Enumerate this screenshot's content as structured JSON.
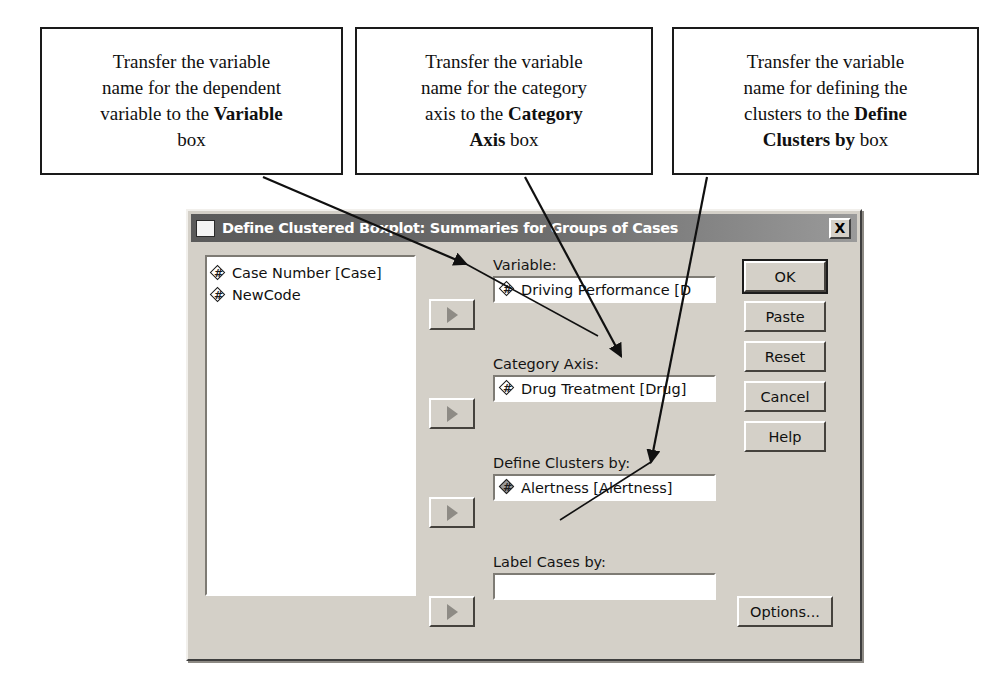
{
  "callouts": [
    {
      "id": "variable",
      "line1": "Transfer the variable",
      "line2": "name for the dependent",
      "line3_pre": "variable to the ",
      "line3_bold": "Variable",
      "line4": "box"
    },
    {
      "id": "category-axis",
      "line1": "Transfer the variable",
      "line2": "name for the category",
      "line3_pre": "axis to the ",
      "line3_bold": "Category",
      "line4_bold": "Axis",
      "line4_post": " box"
    },
    {
      "id": "clusters",
      "line1": "Transfer the variable",
      "line2": "name for defining the",
      "line3_pre": "clusters to the ",
      "line3_bold": "Define",
      "line4_bold": "Clusters by",
      "line4_post": " box"
    }
  ],
  "dialog": {
    "title": "Define Clustered Boxplot: Summaries for Groups of Cases",
    "close_label": "X",
    "source_variables": [
      {
        "label": "Case Number [Case]",
        "icon": "scale-measure-icon"
      },
      {
        "label": "NewCode",
        "icon": "scale-measure-icon"
      }
    ],
    "fields": [
      {
        "id": "variable",
        "label": "Variable:",
        "value": "Driving Performance [D",
        "placeholder": "",
        "selected": false,
        "transfer_button_label": "▶"
      },
      {
        "id": "category-axis",
        "label": "Category Axis:",
        "value": "Drug Treatment [Drug]",
        "placeholder": "",
        "selected": false,
        "transfer_button_label": "▶"
      },
      {
        "id": "define-clusters-by",
        "label": "Define Clusters by:",
        "value": "Alertness [Alertness]",
        "placeholder": "",
        "selected": true,
        "transfer_button_label": "▶"
      },
      {
        "id": "label-cases-by",
        "label": "Label Cases by:",
        "value": "",
        "placeholder": "",
        "selected": false,
        "transfer_button_label": "▶"
      }
    ],
    "buttons": {
      "ok": "OK",
      "paste": "Paste",
      "reset": "Reset",
      "cancel": "Cancel",
      "help": "Help",
      "options": "Options..."
    }
  },
  "colors": {
    "dialog_face": "#d4d0c8",
    "titlebar_dark": "#5a5a5a",
    "titlebar_light": "#9a9a9a",
    "field_white": "#ffffff",
    "ink": "#101010"
  }
}
